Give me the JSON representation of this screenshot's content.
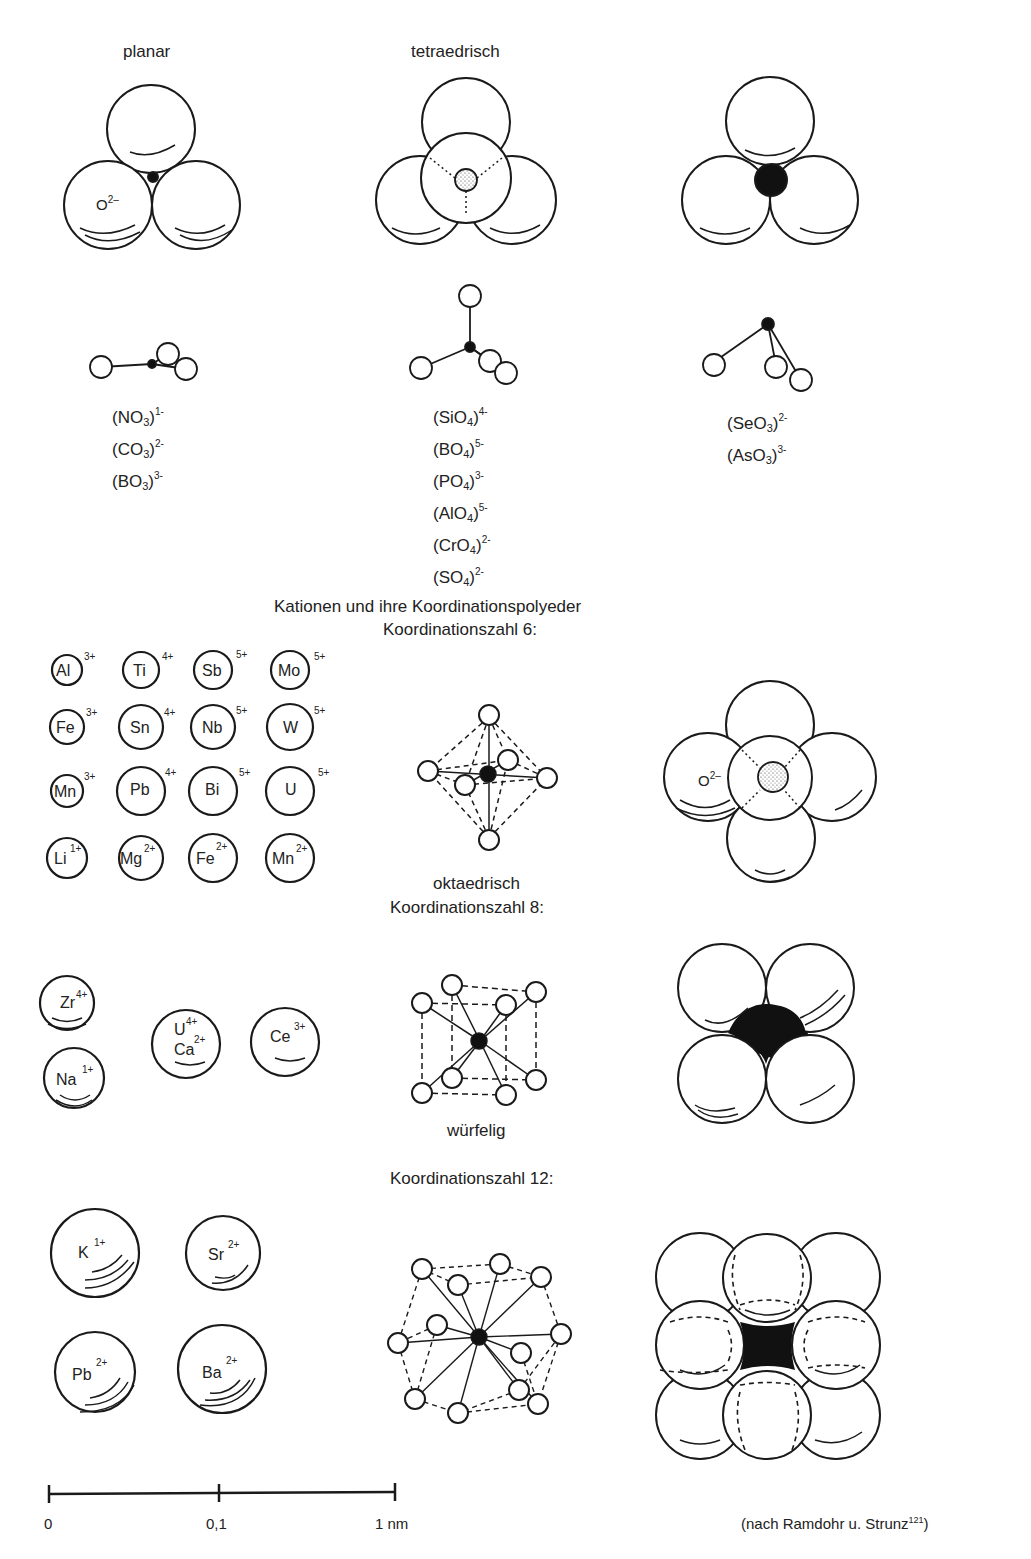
{
  "headers": {
    "planar": "planar",
    "tetraedrisch": "tetraedrisch"
  },
  "anion_groups": {
    "planar": [
      "(NO3)1-",
      "(CO3)2-",
      "(BO3)3-"
    ],
    "tetraedrisch": [
      "(SiO4)4-",
      "(BO4)5-",
      "(PO4)3-",
      "(AlO4)5-",
      "(CrO4)2-",
      "(SO4)2-"
    ],
    "pyramidal": [
      "(SeO3)2-",
      "(AsO3)3-"
    ]
  },
  "formulas": {
    "planar": [
      {
        "base": "(NO",
        "sub": "3",
        "close": ")",
        "charge": "1-"
      },
      {
        "base": "(CO",
        "sub": "3",
        "close": ")",
        "charge": "2-"
      },
      {
        "base": "(BO",
        "sub": "3",
        "close": ")",
        "charge": "3-"
      }
    ],
    "tetra": [
      {
        "base": "(SiO",
        "sub": "4",
        "close": ")",
        "charge": "4-"
      },
      {
        "base": "(BO",
        "sub": "4",
        "close": ")",
        "charge": "5-"
      },
      {
        "base": "(PO",
        "sub": "4",
        "close": ")",
        "charge": "3-"
      },
      {
        "base": "(AlO",
        "sub": "4",
        "close": ")",
        "charge": "5-"
      },
      {
        "base": "(CrO",
        "sub": "4",
        "close": ")",
        "charge": "2-"
      },
      {
        "base": "(SO",
        "sub": "4",
        "close": ")",
        "charge": "2-"
      }
    ],
    "pyramidal": [
      {
        "base": "(SeO",
        "sub": "3",
        "close": ")",
        "charge": "2-"
      },
      {
        "base": "(AsO",
        "sub": "3",
        "close": ")",
        "charge": "3-"
      }
    ]
  },
  "oxygen_label": {
    "symbol": "O",
    "charge": "2–"
  },
  "section_title": "Kationen und ihre Koordinationspolyeder",
  "cn6": {
    "title": "Koordinationszahl 6:",
    "shape_label": "oktaedrisch",
    "cations": [
      {
        "el": "Al",
        "ch": "3+"
      },
      {
        "el": "Ti",
        "ch": "4+"
      },
      {
        "el": "Sb",
        "ch": "5+"
      },
      {
        "el": "Mo",
        "ch": "5+"
      },
      {
        "el": "Fe",
        "ch": "3+"
      },
      {
        "el": "Sn",
        "ch": "4+"
      },
      {
        "el": "Nb",
        "ch": "5+"
      },
      {
        "el": "W",
        "ch": "5+"
      },
      {
        "el": "Mn",
        "ch": "3+"
      },
      {
        "el": "Pb",
        "ch": "4+"
      },
      {
        "el": "Bi",
        "ch": "5+"
      },
      {
        "el": "U",
        "ch": "5+"
      },
      {
        "el": "Li",
        "ch": "1+"
      },
      {
        "el": "Mg",
        "ch": "2+"
      },
      {
        "el": "Fe",
        "ch": "2+"
      },
      {
        "el": "Mn",
        "ch": "2+"
      }
    ]
  },
  "cn8": {
    "title": "Koordinationszahl 8:",
    "shape_label": "würfelig",
    "cations": [
      {
        "el": "Zr",
        "ch": "4+"
      },
      {
        "el": "Na",
        "ch": "1+"
      },
      {
        "el": "U",
        "ch": "4+",
        "el2": "Ca",
        "ch2": "2+"
      },
      {
        "el": "Ce",
        "ch": "3+"
      }
    ]
  },
  "cn12": {
    "title": "Koordinationszahl 12:",
    "cations": [
      {
        "el": "K",
        "ch": "1+"
      },
      {
        "el": "Sr",
        "ch": "2+"
      },
      {
        "el": "Pb",
        "ch": "2+"
      },
      {
        "el": "Ba",
        "ch": "2+"
      }
    ]
  },
  "scale_bar": {
    "ticks": [
      "0",
      "0,1",
      "1 nm"
    ]
  },
  "citation": {
    "text": "(nach Ramdohr u. Strunz",
    "ref": "121",
    "close": ")"
  }
}
